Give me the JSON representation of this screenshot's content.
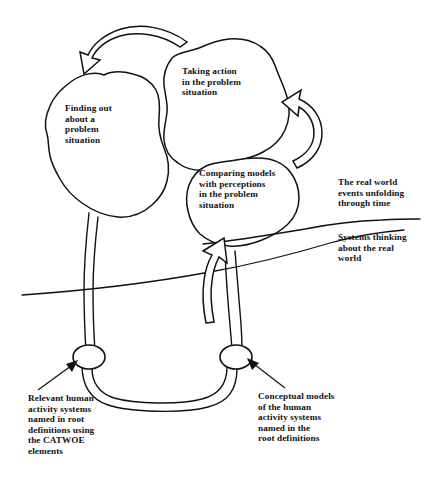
{
  "diagram": {
    "background_color": "#ffffff",
    "ink_color": "#111111",
    "blobs": [
      {
        "id": "finding-out",
        "label": "Finding out\nabout a\nproblem\nsituation"
      },
      {
        "id": "taking-action",
        "label": "Taking action\nin the problem\nsituation"
      },
      {
        "id": "comparing-models",
        "label": "Comparing models\nwith perceptions\nin the problem\nsituation"
      }
    ],
    "side_annotations": [
      {
        "id": "real-world",
        "label": "The real world\nevents unfolding\nthrough time"
      },
      {
        "id": "systems-thinking",
        "label": "Systems thinking\nabout the real\nworld"
      }
    ],
    "node_annotations": [
      {
        "id": "relevant-human-activity-systems",
        "label": "Relevant human\nactivity systems\nnamed in root\ndefinitions using\nthe CATWOE\nelements"
      },
      {
        "id": "conceptual-models",
        "label": "Conceptual models\nof the human\nactivity systems\nnamed in the\nroot definitions"
      }
    ],
    "arrows": [
      {
        "id": "action-to-finding-out",
        "style": "hollow-curved"
      },
      {
        "id": "comparing-to-action",
        "style": "hollow-curved-loop"
      },
      {
        "id": "models-to-comparing",
        "style": "hollow-straight-up"
      }
    ],
    "nodes": [
      {
        "id": "left-node",
        "shape": "ellipse"
      },
      {
        "id": "right-node",
        "shape": "ellipse"
      }
    ],
    "divider": {
      "id": "real-world-systems-thinking-boundary",
      "shape": "curved-horizontal-line"
    }
  }
}
